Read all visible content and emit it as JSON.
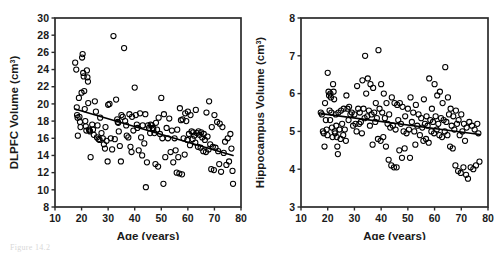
{
  "figure": {
    "caption_fragment": "Figure 14.2",
    "panel_count": 2
  },
  "chart_data": [
    {
      "type": "scatter",
      "panel": "left",
      "title": "",
      "xlabel": "Age (years)",
      "ylabel": "DLPFC Volume (cm³)",
      "ylabel_base": "DLPFC Volume (cm",
      "ylabel_sup": "3",
      "ylabel_close": ")",
      "xlim": [
        10,
        80
      ],
      "ylim": [
        8,
        30
      ],
      "xticks": [
        10,
        20,
        30,
        40,
        50,
        60,
        70,
        80
      ],
      "yticks": [
        8,
        10,
        12,
        14,
        16,
        18,
        20,
        22,
        24,
        26,
        28,
        30
      ],
      "grid": false,
      "legend": false,
      "marker": "open-circle",
      "marker_color": "#000000",
      "trendline": {
        "x": [
          17.5,
          77.0
        ],
        "y": [
          19.4,
          14.0
        ],
        "color": "#000000",
        "width": 1.6
      },
      "points": [
        [
          17.6,
          24.8
        ],
        [
          18.0,
          24.0
        ],
        [
          18.2,
          19.6
        ],
        [
          18.3,
          18.7
        ],
        [
          18.5,
          18.4
        ],
        [
          18.6,
          16.3
        ],
        [
          19.0,
          20.7
        ],
        [
          19.2,
          18.5
        ],
        [
          19.4,
          17.9
        ],
        [
          19.6,
          17.3
        ],
        [
          20.0,
          21.3
        ],
        [
          20.2,
          25.4
        ],
        [
          20.4,
          25.8
        ],
        [
          20.6,
          23.6
        ],
        [
          20.8,
          23.2
        ],
        [
          21.0,
          21.5
        ],
        [
          21.2,
          19.4
        ],
        [
          21.4,
          18.0
        ],
        [
          21.6,
          17.4
        ],
        [
          21.8,
          16.9
        ],
        [
          22.0,
          23.9
        ],
        [
          22.2,
          23.1
        ],
        [
          22.4,
          22.6
        ],
        [
          22.5,
          20.1
        ],
        [
          22.8,
          17.0
        ],
        [
          23.0,
          16.9
        ],
        [
          23.2,
          16.8
        ],
        [
          23.4,
          13.8
        ],
        [
          24.0,
          17.6
        ],
        [
          24.3,
          17.0
        ],
        [
          24.6,
          16.4
        ],
        [
          25.0,
          20.3
        ],
        [
          25.4,
          19.1
        ],
        [
          25.8,
          16.1
        ],
        [
          26.0,
          17.5
        ],
        [
          26.4,
          15.9
        ],
        [
          26.8,
          15.8
        ],
        [
          27.0,
          18.4
        ],
        [
          27.5,
          16.6
        ],
        [
          28.0,
          16.0
        ],
        [
          28.4,
          15.3
        ],
        [
          28.8,
          14.8
        ],
        [
          29.0,
          17.3
        ],
        [
          29.4,
          15.7
        ],
        [
          29.8,
          13.3
        ],
        [
          30.0,
          19.9
        ],
        [
          30.5,
          20.0
        ],
        [
          31.0,
          16.0
        ],
        [
          31.5,
          14.7
        ],
        [
          32.0,
          27.9
        ],
        [
          32.5,
          15.9
        ],
        [
          33.0,
          20.5
        ],
        [
          33.4,
          18.2
        ],
        [
          33.6,
          17.9
        ],
        [
          33.8,
          17.8
        ],
        [
          34.0,
          16.8
        ],
        [
          34.4,
          15.1
        ],
        [
          34.8,
          13.3
        ],
        [
          35.0,
          18.7
        ],
        [
          35.5,
          18.5
        ],
        [
          36.0,
          26.5
        ],
        [
          36.4,
          18.0
        ],
        [
          36.8,
          17.5
        ],
        [
          37.0,
          16.3
        ],
        [
          37.6,
          16.1
        ],
        [
          38.0,
          18.8
        ],
        [
          38.4,
          15.0
        ],
        [
          38.8,
          14.4
        ],
        [
          39.0,
          18.5
        ],
        [
          39.5,
          16.9
        ],
        [
          40.0,
          21.9
        ],
        [
          40.4,
          18.7
        ],
        [
          40.8,
          17.6
        ],
        [
          41.0,
          17.2
        ],
        [
          41.5,
          14.6
        ],
        [
          42.0,
          18.9
        ],
        [
          42.4,
          16.1
        ],
        [
          42.8,
          14.0
        ],
        [
          43.0,
          17.5
        ],
        [
          43.6,
          15.4
        ],
        [
          44.0,
          18.8
        ],
        [
          44.2,
          10.3
        ],
        [
          44.6,
          13.2
        ],
        [
          45.0,
          17.5
        ],
        [
          45.4,
          17.2
        ],
        [
          45.8,
          16.6
        ],
        [
          46.0,
          17.6
        ],
        [
          46.4,
          17.5
        ],
        [
          46.8,
          17.2
        ],
        [
          47.0,
          17.1
        ],
        [
          47.4,
          16.6
        ],
        [
          47.8,
          13.0
        ],
        [
          48.0,
          17.8
        ],
        [
          48.4,
          17.0
        ],
        [
          48.8,
          12.7
        ],
        [
          49.0,
          18.4
        ],
        [
          49.5,
          16.5
        ],
        [
          50.0,
          20.7
        ],
        [
          50.4,
          16.0
        ],
        [
          50.8,
          10.7
        ],
        [
          51.0,
          18.8
        ],
        [
          51.5,
          13.8
        ],
        [
          52.0,
          17.2
        ],
        [
          52.5,
          16.0
        ],
        [
          53.0,
          18.3
        ],
        [
          53.5,
          14.4
        ],
        [
          54.0,
          16.9
        ],
        [
          54.5,
          13.2
        ],
        [
          55.0,
          16.0
        ],
        [
          55.4,
          14.6
        ],
        [
          55.8,
          12.0
        ],
        [
          56.0,
          17.0
        ],
        [
          56.4,
          13.8
        ],
        [
          56.8,
          11.9
        ],
        [
          57.0,
          19.5
        ],
        [
          57.4,
          18.1
        ],
        [
          57.8,
          11.8
        ],
        [
          58.0,
          18.2
        ],
        [
          58.4,
          16.0
        ],
        [
          58.8,
          14.1
        ],
        [
          59.0,
          18.9
        ],
        [
          59.4,
          18.0
        ],
        [
          59.8,
          15.8
        ],
        [
          60.0,
          19.1
        ],
        [
          60.4,
          16.5
        ],
        [
          60.8,
          15.2
        ],
        [
          61.0,
          18.7
        ],
        [
          61.4,
          16.8
        ],
        [
          61.8,
          15.9
        ],
        [
          62.0,
          16.7
        ],
        [
          62.4,
          16.3
        ],
        [
          62.8,
          15.5
        ],
        [
          63.0,
          19.3
        ],
        [
          63.4,
          16.6
        ],
        [
          63.8,
          15.0
        ],
        [
          64.0,
          16.8
        ],
        [
          64.4,
          16.4
        ],
        [
          64.8,
          14.9
        ],
        [
          65.0,
          16.7
        ],
        [
          65.4,
          16.1
        ],
        [
          65.8,
          14.5
        ],
        [
          66.0,
          16.5
        ],
        [
          66.4,
          15.8
        ],
        [
          66.8,
          14.4
        ],
        [
          67.0,
          19.0
        ],
        [
          67.4,
          16.2
        ],
        [
          67.8,
          14.7
        ],
        [
          68.0,
          20.3
        ],
        [
          68.4,
          15.3
        ],
        [
          68.8,
          12.4
        ],
        [
          69.0,
          17.3
        ],
        [
          69.4,
          15.0
        ],
        [
          69.8,
          12.3
        ],
        [
          70.0,
          18.7
        ],
        [
          70.4,
          14.9
        ],
        [
          71.0,
          17.9
        ],
        [
          71.4,
          14.5
        ],
        [
          71.8,
          13.0
        ],
        [
          72.0,
          17.7
        ],
        [
          72.5,
          12.1
        ],
        [
          73.0,
          17.3
        ],
        [
          73.5,
          14.3
        ],
        [
          74.0,
          15.6
        ],
        [
          74.5,
          12.9
        ],
        [
          75.0,
          16.0
        ],
        [
          75.5,
          13.3
        ],
        [
          76.0,
          16.5
        ],
        [
          76.4,
          14.8
        ],
        [
          76.8,
          12.2
        ],
        [
          77.0,
          10.7
        ]
      ]
    },
    {
      "type": "scatter",
      "panel": "right",
      "title": "",
      "xlabel": "Age (years)",
      "ylabel": "Hippocampus Volume (cm³)",
      "ylabel_base": "Hippocampus Volume (cm",
      "ylabel_sup": "3",
      "ylabel_close": ")",
      "xlim": [
        10,
        80
      ],
      "ylim": [
        3,
        8
      ],
      "xticks": [
        10,
        20,
        30,
        40,
        50,
        60,
        70,
        80
      ],
      "yticks": [
        3,
        4,
        5,
        6,
        7,
        8
      ],
      "grid": false,
      "legend": false,
      "marker": "open-circle",
      "marker_color": "#000000",
      "trendline": {
        "x": [
          17.5,
          77.0
        ],
        "y": [
          5.47,
          4.92
        ],
        "color": "#000000",
        "width": 1.6
      },
      "points": [
        [
          17.4,
          5.5
        ],
        [
          17.8,
          5.45
        ],
        [
          18.2,
          5.0
        ],
        [
          18.5,
          4.95
        ],
        [
          18.8,
          4.6
        ],
        [
          19.0,
          5.75
        ],
        [
          19.3,
          5.3
        ],
        [
          19.6,
          5.05
        ],
        [
          19.9,
          4.9
        ],
        [
          20.0,
          6.55
        ],
        [
          20.3,
          6.05
        ],
        [
          20.5,
          5.95
        ],
        [
          20.7,
          5.55
        ],
        [
          20.9,
          5.3
        ],
        [
          21.0,
          6.0
        ],
        [
          21.2,
          5.9
        ],
        [
          21.4,
          5.5
        ],
        [
          21.6,
          5.1
        ],
        [
          21.8,
          4.85
        ],
        [
          22.0,
          6.25
        ],
        [
          22.2,
          6.05
        ],
        [
          22.4,
          5.85
        ],
        [
          22.6,
          5.0
        ],
        [
          22.8,
          4.95
        ],
        [
          23.0,
          5.45
        ],
        [
          23.2,
          5.15
        ],
        [
          23.4,
          4.85
        ],
        [
          23.6,
          4.6
        ],
        [
          23.8,
          4.4
        ],
        [
          24.0,
          5.5
        ],
        [
          24.4,
          5.05
        ],
        [
          24.8,
          4.8
        ],
        [
          25.0,
          5.55
        ],
        [
          25.4,
          5.2
        ],
        [
          25.8,
          4.9
        ],
        [
          26.0,
          5.6
        ],
        [
          26.4,
          5.05
        ],
        [
          26.8,
          4.75
        ],
        [
          27.0,
          5.95
        ],
        [
          27.4,
          5.6
        ],
        [
          27.8,
          5.3
        ],
        [
          28.0,
          5.65
        ],
        [
          28.5,
          5.45
        ],
        [
          29.0,
          5.5
        ],
        [
          29.5,
          5.15
        ],
        [
          30.0,
          5.45
        ],
        [
          30.4,
          5.2
        ],
        [
          30.8,
          5.0
        ],
        [
          31.0,
          6.2
        ],
        [
          31.4,
          5.6
        ],
        [
          31.8,
          5.2
        ],
        [
          32.0,
          5.5
        ],
        [
          32.4,
          5.25
        ],
        [
          32.8,
          4.95
        ],
        [
          33.0,
          6.35
        ],
        [
          33.4,
          5.6
        ],
        [
          33.8,
          5.35
        ],
        [
          34.0,
          7.0
        ],
        [
          34.4,
          6.0
        ],
        [
          34.8,
          5.4
        ],
        [
          35.0,
          6.4
        ],
        [
          35.4,
          5.55
        ],
        [
          35.8,
          5.15
        ],
        [
          36.0,
          6.25
        ],
        [
          36.4,
          5.45
        ],
        [
          36.8,
          4.65
        ],
        [
          37.0,
          6.15
        ],
        [
          37.4,
          5.5
        ],
        [
          37.8,
          5.25
        ],
        [
          38.0,
          5.75
        ],
        [
          38.4,
          5.35
        ],
        [
          38.8,
          4.8
        ],
        [
          39.0,
          7.15
        ],
        [
          39.4,
          5.6
        ],
        [
          39.8,
          4.75
        ],
        [
          40.0,
          6.25
        ],
        [
          40.4,
          5.5
        ],
        [
          40.8,
          4.85
        ],
        [
          41.0,
          6.0
        ],
        [
          41.4,
          5.35
        ],
        [
          41.8,
          4.6
        ],
        [
          42.0,
          5.75
        ],
        [
          42.4,
          5.2
        ],
        [
          42.8,
          4.25
        ],
        [
          43.0,
          5.45
        ],
        [
          43.4,
          5.1
        ],
        [
          43.8,
          4.1
        ],
        [
          44.0,
          5.9
        ],
        [
          44.4,
          5.15
        ],
        [
          44.8,
          4.05
        ],
        [
          45.0,
          5.75
        ],
        [
          45.4,
          5.05
        ],
        [
          45.8,
          4.05
        ],
        [
          46.0,
          5.7
        ],
        [
          46.4,
          5.3
        ],
        [
          46.8,
          4.5
        ],
        [
          47.0,
          5.75
        ],
        [
          47.4,
          5.2
        ],
        [
          47.8,
          4.3
        ],
        [
          48.0,
          5.65
        ],
        [
          48.4,
          5.0
        ],
        [
          48.8,
          4.55
        ],
        [
          49.0,
          5.4
        ],
        [
          49.5,
          4.95
        ],
        [
          50.0,
          5.6
        ],
        [
          50.4,
          5.05
        ],
        [
          50.8,
          4.3
        ],
        [
          51.0,
          5.9
        ],
        [
          51.5,
          5.25
        ],
        [
          52.0,
          5.5
        ],
        [
          52.4,
          5.0
        ],
        [
          52.8,
          4.65
        ],
        [
          53.0,
          5.7
        ],
        [
          53.5,
          5.15
        ],
        [
          54.0,
          5.45
        ],
        [
          54.5,
          4.9
        ],
        [
          55.0,
          5.35
        ],
        [
          55.4,
          5.1
        ],
        [
          55.8,
          4.75
        ],
        [
          56.0,
          5.85
        ],
        [
          56.4,
          5.2
        ],
        [
          56.8,
          4.8
        ],
        [
          57.0,
          5.4
        ],
        [
          57.4,
          5.15
        ],
        [
          57.8,
          4.7
        ],
        [
          58.0,
          6.4
        ],
        [
          58.4,
          5.3
        ],
        [
          58.8,
          5.0
        ],
        [
          59.0,
          5.6
        ],
        [
          59.4,
          5.25
        ],
        [
          59.8,
          4.95
        ],
        [
          60.0,
          6.25
        ],
        [
          60.4,
          5.4
        ],
        [
          60.8,
          5.05
        ],
        [
          61.0,
          5.95
        ],
        [
          61.4,
          5.2
        ],
        [
          61.8,
          4.9
        ],
        [
          62.0,
          6.05
        ],
        [
          62.4,
          5.35
        ],
        [
          62.8,
          4.85
        ],
        [
          63.0,
          5.75
        ],
        [
          63.4,
          5.3
        ],
        [
          63.8,
          5.0
        ],
        [
          64.0,
          6.7
        ],
        [
          64.4,
          5.25
        ],
        [
          64.8,
          4.9
        ],
        [
          65.0,
          5.9
        ],
        [
          65.4,
          5.45
        ],
        [
          65.8,
          4.6
        ],
        [
          66.0,
          5.6
        ],
        [
          66.4,
          5.15
        ],
        [
          66.8,
          4.55
        ],
        [
          67.0,
          5.4
        ],
        [
          67.4,
          5.05
        ],
        [
          67.8,
          4.1
        ],
        [
          68.0,
          5.55
        ],
        [
          68.4,
          5.2
        ],
        [
          68.8,
          3.95
        ],
        [
          69.0,
          5.3
        ],
        [
          69.4,
          4.9
        ],
        [
          69.8,
          3.9
        ],
        [
          70.0,
          5.45
        ],
        [
          70.4,
          5.0
        ],
        [
          70.8,
          4.05
        ],
        [
          71.0,
          5.2
        ],
        [
          71.4,
          4.75
        ],
        [
          71.8,
          3.85
        ],
        [
          72.0,
          5.1
        ],
        [
          72.5,
          3.75
        ],
        [
          73.0,
          5.25
        ],
        [
          73.5,
          4.05
        ],
        [
          74.0,
          5.15
        ],
        [
          74.5,
          4.0
        ],
        [
          75.0,
          5.05
        ],
        [
          75.5,
          4.1
        ],
        [
          76.0,
          5.2
        ],
        [
          76.4,
          4.95
        ],
        [
          76.8,
          4.2
        ]
      ]
    }
  ]
}
